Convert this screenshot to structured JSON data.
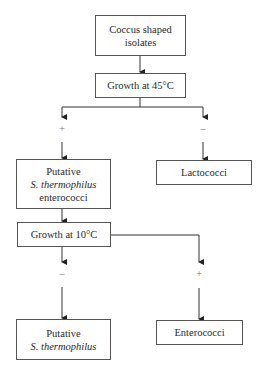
{
  "diagram": {
    "type": "flowchart",
    "nodes": {
      "start": {
        "lines": [
          "Coccus shaped",
          "isolates"
        ]
      },
      "growth45": {
        "label": "Growth at 45°C"
      },
      "putative_entero": {
        "line1": "Putative",
        "line2_italic": "S. thermophilus",
        "line3": "enterococci"
      },
      "lactococci": {
        "label": "Lactococci"
      },
      "growth10": {
        "label": "Growth at 10°C"
      },
      "putative_sthermo": {
        "line1": "Putative",
        "line2_italic": "S. thermophilus"
      },
      "enterococci": {
        "label": "Enterococci"
      }
    },
    "edges": [
      {
        "from": "start",
        "to": "growth45",
        "label": ""
      },
      {
        "from": "growth45",
        "to": "putative_entero",
        "label": "+"
      },
      {
        "from": "growth45",
        "to": "lactococci",
        "label": "–"
      },
      {
        "from": "putative_entero",
        "to": "growth10",
        "label": ""
      },
      {
        "from": "growth10",
        "to": "putative_sthermo",
        "label": "–"
      },
      {
        "from": "growth10",
        "to": "enterococci",
        "label": "+"
      }
    ]
  }
}
